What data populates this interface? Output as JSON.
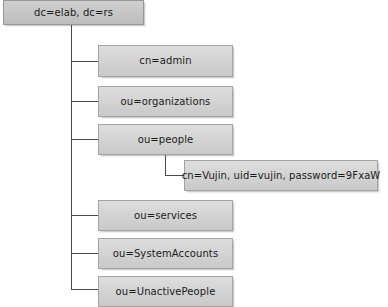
{
  "diagram": {
    "type": "tree",
    "colors": {
      "background": "#ffffff",
      "node_fill_top": "#dedede",
      "node_fill_bottom": "#c9c9c9",
      "root_fill_top": "#d0d0d0",
      "root_fill_bottom": "#bdbdbd",
      "node_border": "#a3a3a3",
      "connector": "#4a4a4a",
      "text": "#1b1b1b"
    },
    "root": {
      "label": "dc=elab, dc=rs"
    },
    "children": [
      {
        "label": "cn=admin"
      },
      {
        "label": "ou=organizations"
      },
      {
        "label": "ou=people"
      },
      {
        "label": "ou=services"
      },
      {
        "label": "ou=SystemAccounts"
      },
      {
        "label": "ou=UnactivePeople"
      }
    ],
    "grandchildren": [
      {
        "parent": "ou=people",
        "label": "cn=Vujin, uid=vujin, password=9FxaW"
      }
    ]
  }
}
